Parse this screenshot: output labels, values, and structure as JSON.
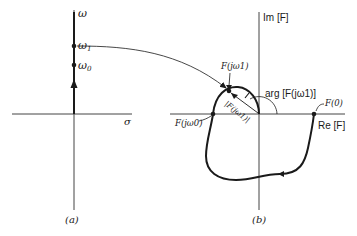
{
  "panel_a": {
    "caption": "(a)",
    "vertical_axis_label": "ω",
    "horizontal_axis_label": "σ",
    "points": [
      {
        "label": "ω",
        "sub": "1"
      },
      {
        "label": "ω",
        "sub": "0"
      }
    ]
  },
  "panel_b": {
    "caption": "(b)",
    "vertical_axis_label": "Im [F]",
    "horizontal_axis_label": "Re [F]",
    "point_f_jw1": "F(jω1)",
    "point_f_jw0": "F(jω0)",
    "point_f0": "F(0)",
    "magnitude_label": "|F(jω1)|",
    "angle_label": "arg [F(jω1)]"
  },
  "colors": {
    "line": "#1a1a1a",
    "axis": "#444444",
    "background": "#ffffff"
  }
}
